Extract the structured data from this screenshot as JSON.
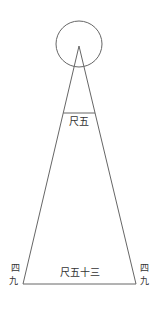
{
  "diagram": {
    "type": "triangle-with-circle",
    "stroke_color": "#666666",
    "text_color": "#333333",
    "circle": {
      "cx": 79,
      "cy": 44,
      "r": 23
    },
    "apex": {
      "x": 79,
      "y": 46
    },
    "base_left": {
      "x": 23,
      "y": 284
    },
    "base_right": {
      "x": 136,
      "y": 284
    },
    "upper_crossbar_y": 113,
    "labels": {
      "upper_width": "尺五",
      "base_width": "尺五十三",
      "left_side_top": "四",
      "left_side_bottom": "九",
      "right_side_top": "四",
      "right_side_bottom": "九"
    }
  }
}
